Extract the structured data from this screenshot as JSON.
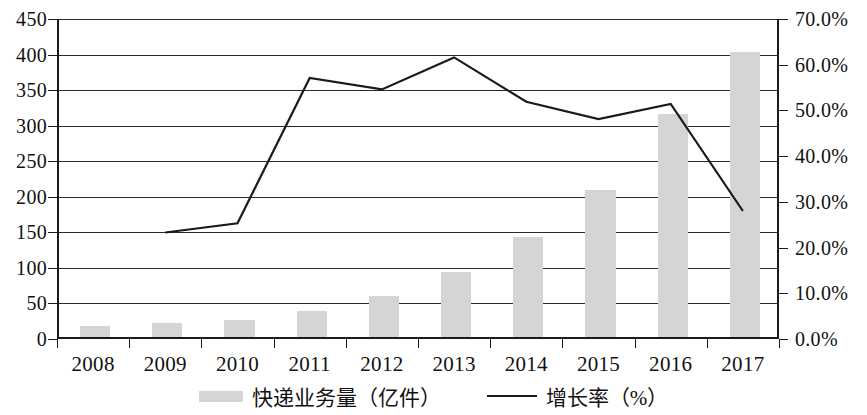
{
  "chart_data": {
    "type": "bar",
    "title": "",
    "xlabel": "",
    "categories": [
      "2008",
      "2009",
      "2010",
      "2011",
      "2012",
      "2013",
      "2014",
      "2015",
      "2016",
      "2017"
    ],
    "series": [
      {
        "name": "快递业务量（亿件）",
        "type": "bar",
        "axis": "left",
        "values": [
          15,
          20,
          24,
          37,
          57,
          92,
          140,
          207,
          313,
          401
        ],
        "color": "#d5d5d5"
      },
      {
        "name": "增长率（%）",
        "type": "line",
        "axis": "right",
        "values": [
          23.3,
          25.3,
          57.1,
          54.6,
          61.6,
          51.9,
          48.1,
          51.4,
          28.0
        ],
        "x": [
          "2009",
          "2010",
          "2011",
          "2012",
          "2013",
          "2014",
          "2015",
          "2016",
          "2017"
        ],
        "color": "#1a1a1a"
      }
    ],
    "y_left": {
      "ticks": [
        "0",
        "50",
        "100",
        "150",
        "200",
        "250",
        "300",
        "350",
        "400",
        "450"
      ],
      "values": [
        0,
        50,
        100,
        150,
        200,
        250,
        300,
        350,
        400,
        450
      ],
      "ylim": [
        0,
        450
      ],
      "label": ""
    },
    "y_right": {
      "ticks": [
        "0.0%",
        "10.0%",
        "20.0%",
        "30.0%",
        "40.0%",
        "50.0%",
        "60.0%",
        "70.0%"
      ],
      "values": [
        0,
        10,
        20,
        30,
        40,
        50,
        60,
        70
      ],
      "ylim": [
        0,
        70
      ],
      "label": ""
    },
    "grid": true,
    "legend_position": "bottom"
  },
  "legend": {
    "items": [
      {
        "label": "快递业务量（亿件）",
        "marker": "bar-swatch"
      },
      {
        "label": "增长率（%）",
        "marker": "line-swatch"
      }
    ]
  }
}
